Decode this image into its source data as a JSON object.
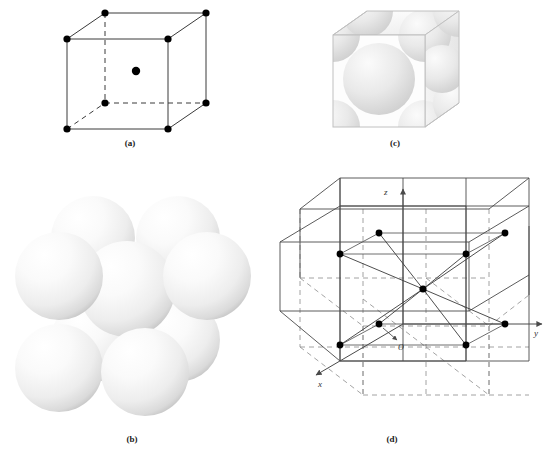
{
  "figure": {
    "background": "#ffffff",
    "panels": [
      {
        "id": "a",
        "caption": "(a)",
        "kind": "reduced-sphere-unit-cell",
        "description": "Reduced-sphere unit cell: cubic outline with atoms at the eight corners and one atom at the body center",
        "atom_count": 9,
        "corner_atoms": 8,
        "center_atoms": 1,
        "atom_color": "#000000",
        "edge_color": "#3a3a3a",
        "hidden_edge_style": "dashed"
      },
      {
        "id": "b",
        "caption": "(b)",
        "kind": "hard-sphere-model",
        "description": "Hard-sphere model: nine touching spheres, eight at the cube corners and one in the body center",
        "sphere_count": 9,
        "sphere_color": "#f2f2f2",
        "sphere_highlight": "#ffffff",
        "sphere_shadow": "#c9c9c9"
      },
      {
        "id": "c",
        "caption": "(c)",
        "kind": "aggregate-cut-away",
        "description": "Cut-away cube showing the curved sphere sections of the corner and body-center atoms",
        "cube_face_color": "#fdfdfd",
        "sphere_section_color": "#e2e2e2",
        "outline_color": "#c0c0c0"
      },
      {
        "id": "d",
        "caption": "(d)",
        "kind": "aggregate-with-axes",
        "description": "Aggregate of body-centered cubic cells with coordinate axes, origin O, and the body-center atom bonded to the eight surrounding corner atoms",
        "axes": [
          "x",
          "y",
          "z"
        ],
        "origin_label": "O",
        "coordination_number": 8,
        "lattice_cells": "2 x 2 x 2",
        "solid_line_color": "#4a4a4a",
        "dashed_line_color": "#8c8c8c",
        "atom_color": "#000000"
      }
    ],
    "labels": {
      "axis_x": "x",
      "axis_y": "y",
      "axis_z": "z",
      "origin": "O"
    }
  }
}
